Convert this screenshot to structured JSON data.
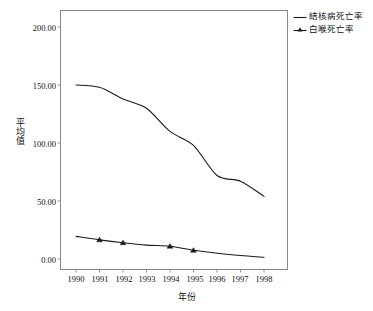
{
  "chart_data": {
    "type": "line",
    "title": "",
    "xlabel": "年份",
    "ylabel": "平均值",
    "x": [
      1990,
      1991,
      1992,
      1993,
      1994,
      1995,
      1996,
      1997,
      1998
    ],
    "categories": [
      "1990",
      "1991",
      "1992",
      "1993",
      "1994",
      "1995",
      "1996",
      "1997",
      "1998"
    ],
    "series": [
      {
        "name": "结核病死亡率",
        "marker": "none",
        "values": [
          150.0,
          148.0,
          138.0,
          130.0,
          110.0,
          98.0,
          72.0,
          67.0,
          54.0
        ]
      },
      {
        "name": "白喉死亡率",
        "marker": "triangle",
        "values": [
          19.5,
          16.5,
          14.0,
          12.0,
          11.0,
          7.5,
          5.0,
          3.0,
          1.5
        ]
      }
    ],
    "ylim": [
      0,
      200
    ],
    "yticks": [
      0,
      50,
      100,
      150,
      200
    ],
    "ytick_labels": [
      "0.00",
      "50.00",
      "100.00",
      "150.00",
      "200.00"
    ],
    "xlim": [
      1990,
      1998
    ],
    "grid": false,
    "legend_position": "top-right-outside",
    "line_color": "#1a1a1a",
    "frame_color": "#8a8a8a",
    "background": "#ffffff"
  },
  "axis": {
    "y_title": "平均值",
    "x_title": "年份",
    "y_ticks": [
      {
        "label": "200.00",
        "value": 200
      },
      {
        "label": "150.00",
        "value": 150
      },
      {
        "label": "100.00",
        "value": 100
      },
      {
        "label": "50.00",
        "value": 50
      },
      {
        "label": "0.00",
        "value": 0
      }
    ],
    "x_ticks": [
      {
        "label": "1990"
      },
      {
        "label": "1991"
      },
      {
        "label": "1992"
      },
      {
        "label": "1993"
      },
      {
        "label": "1994"
      },
      {
        "label": "1995"
      },
      {
        "label": "1996"
      },
      {
        "label": "1997"
      },
      {
        "label": "1998"
      }
    ]
  },
  "legend": {
    "entries": [
      {
        "label": "结核病死亡率",
        "icon": "line-key-icon"
      },
      {
        "label": "白喉死亡率",
        "icon": "line-triangle-key-icon"
      }
    ]
  }
}
